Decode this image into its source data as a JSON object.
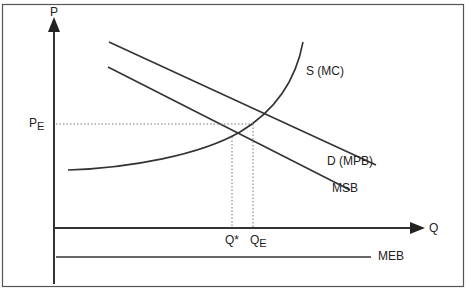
{
  "diagram": {
    "type": "economics-positive-externality",
    "axes": {
      "y_label": "P",
      "x_label": "Q"
    },
    "curves": {
      "supply": "S (MC)",
      "demand": "D (MPB)",
      "msb": "MSB",
      "meb": "MEB"
    },
    "markers": {
      "price_equilibrium": {
        "main": "P",
        "sub": "E"
      },
      "q_optimal": "Q*",
      "q_equilibrium": {
        "main": "Q",
        "sub": "E"
      }
    },
    "colors": {
      "line": "#333333",
      "frame": "#555555",
      "dotted": "#777777",
      "background": "#ffffff"
    }
  }
}
